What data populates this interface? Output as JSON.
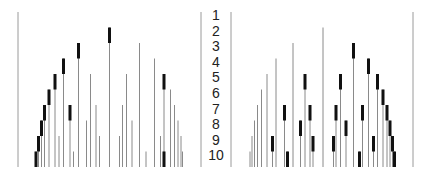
{
  "row_labels": [
    "1",
    "2",
    "3",
    "4",
    "5",
    "6",
    "7",
    "8",
    "9",
    "10"
  ],
  "colors": {
    "thin_line": "#8a8a8a",
    "thick_segment": "#111111",
    "frame": "#9a9a9a",
    "label": "#222222"
  },
  "geometry": {
    "row_top": 12,
    "row_height": 15.5,
    "bottom": 167
  },
  "frame_lines": [
    18,
    201,
    231,
    413
  ],
  "left_panel": {
    "lines": [
      {
        "x": 36,
        "start": 10,
        "thick": 10
      },
      {
        "x": 38.5,
        "start": 9,
        "thick": 9
      },
      {
        "x": 41.5,
        "start": 8,
        "thick": 8
      },
      {
        "x": 44.5,
        "start": 7,
        "thick": 7
      },
      {
        "x": 49,
        "start": 6,
        "thick": 6
      },
      {
        "x": 55,
        "start": 5,
        "thick": 5
      },
      {
        "x": 59,
        "start": 9,
        "thick": null
      },
      {
        "x": 63.5,
        "start": 4,
        "thick": 4
      },
      {
        "x": 70,
        "start": 7,
        "thick": 7
      },
      {
        "x": 73.5,
        "start": 10,
        "thick": null
      },
      {
        "x": 78.5,
        "start": 3,
        "thick": 3
      },
      {
        "x": 86.5,
        "start": 8,
        "thick": null
      },
      {
        "x": 90.5,
        "start": 5,
        "thick": null
      },
      {
        "x": 96,
        "start": 7,
        "thick": null
      },
      {
        "x": 99.5,
        "start": 9,
        "thick": null
      },
      {
        "x": 109.5,
        "start": 2,
        "thick": 2
      },
      {
        "x": 119.5,
        "start": 9,
        "thick": null
      },
      {
        "x": 122.5,
        "start": 7,
        "thick": null
      },
      {
        "x": 126.5,
        "start": 5,
        "thick": null
      },
      {
        "x": 132,
        "start": 8,
        "thick": null
      },
      {
        "x": 139.5,
        "start": 3,
        "thick": null
      },
      {
        "x": 146,
        "start": 10,
        "thick": null
      },
      {
        "x": 154.5,
        "start": 4,
        "thick": null
      },
      {
        "x": 160.5,
        "start": 9,
        "thick": null
      },
      {
        "x": 164,
        "start": 5,
        "thick": 5
      },
      {
        "x": 164,
        "start": 10,
        "thick": 10
      },
      {
        "x": 170.5,
        "start": 6,
        "thick": null
      },
      {
        "x": 174.5,
        "start": 7,
        "thick": null
      },
      {
        "x": 178,
        "start": 8,
        "thick": null
      },
      {
        "x": 181,
        "start": 9,
        "thick": null
      },
      {
        "x": 182.5,
        "start": 10,
        "thick": null
      }
    ]
  },
  "right_panel": {
    "lines": [
      {
        "x": 250,
        "start": 10,
        "thick": null
      },
      {
        "x": 252,
        "start": 9,
        "thick": null
      },
      {
        "x": 254.5,
        "start": 8,
        "thick": null
      },
      {
        "x": 257.5,
        "start": 7,
        "thick": null
      },
      {
        "x": 261.5,
        "start": 6,
        "thick": null
      },
      {
        "x": 267,
        "start": 5,
        "thick": null
      },
      {
        "x": 272.5,
        "start": 9,
        "thick": 9
      },
      {
        "x": 276,
        "start": 4,
        "thick": null
      },
      {
        "x": 284.5,
        "start": 7,
        "thick": 7
      },
      {
        "x": 287.5,
        "start": 10,
        "thick": 10
      },
      {
        "x": 293,
        "start": 3,
        "thick": null
      },
      {
        "x": 300.5,
        "start": 8,
        "thick": 8
      },
      {
        "x": 305,
        "start": 5,
        "thick": 5
      },
      {
        "x": 310,
        "start": 7,
        "thick": 7
      },
      {
        "x": 313,
        "start": 9,
        "thick": 9
      },
      {
        "x": 323,
        "start": 2,
        "thick": null
      },
      {
        "x": 333.5,
        "start": 9,
        "thick": 9
      },
      {
        "x": 336,
        "start": 7,
        "thick": 7
      },
      {
        "x": 340.5,
        "start": 5,
        "thick": 5
      },
      {
        "x": 346,
        "start": 8,
        "thick": 8
      },
      {
        "x": 353.5,
        "start": 3,
        "thick": 3
      },
      {
        "x": 359.5,
        "start": 10,
        "thick": 10
      },
      {
        "x": 362.5,
        "start": 7,
        "thick": 7
      },
      {
        "x": 368.5,
        "start": 4,
        "thick": 4
      },
      {
        "x": 373.5,
        "start": 9,
        "thick": 9
      },
      {
        "x": 377.5,
        "start": 5,
        "thick": 5
      },
      {
        "x": 383,
        "start": 6,
        "thick": 6
      },
      {
        "x": 387,
        "start": 7,
        "thick": 7
      },
      {
        "x": 390,
        "start": 8,
        "thick": 8
      },
      {
        "x": 392.5,
        "start": 9,
        "thick": 9
      },
      {
        "x": 394.5,
        "start": 10,
        "thick": 10
      }
    ]
  }
}
